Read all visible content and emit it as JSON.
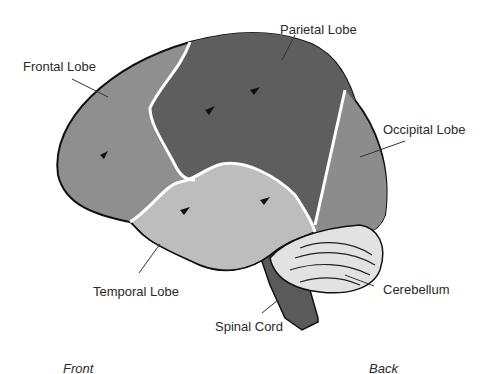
{
  "labels": {
    "frontal": "Frontal Lobe",
    "parietal": "Parietal Lobe",
    "occipital": "Occipital Lobe",
    "temporal": "Temporal Lobe",
    "cerebellum": "Cerebellum",
    "spinal": "Spinal Cord"
  },
  "orientation": {
    "front": "Front",
    "back": "Back"
  },
  "colors": {
    "frontal": "#8f8f8f",
    "parietal": "#5e5e5e",
    "occipital": "#8c8c8c",
    "temporal": "#bdbdbd",
    "cerebellum": "#e2e2e2",
    "spinal": "#5a5a5a",
    "outline": "#111111",
    "boundary": "#ffffff"
  }
}
